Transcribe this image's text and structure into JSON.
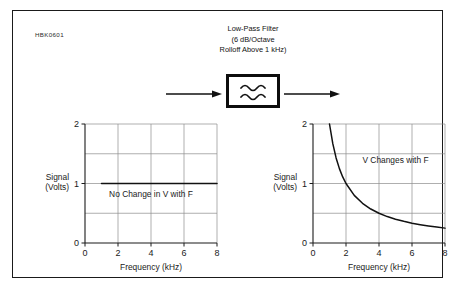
{
  "figure": {
    "id_code": "HBK0601",
    "border_color": "#1a1a1a",
    "background": "#ffffff"
  },
  "filter_block": {
    "caption_line1": "Low-Pass Filter",
    "caption_line2": "(6 dB/Octave",
    "caption_line3": "Rolloff Above 1 kHz)",
    "symbol": "two-wave-lowpass-symbol",
    "input_arrow": "arrow-right-icon",
    "output_arrow": "arrow-right-icon",
    "box_color": "#0d0d0d"
  },
  "chart_data": [
    {
      "id": "input-signal",
      "type": "line",
      "title": "",
      "xlabel": "Frequency (kHz)",
      "ylabel": "Signal\n(Volts)",
      "ylabel_line1": "Signal",
      "ylabel_line2": "(Volts)",
      "annotation": "No Change in V with F",
      "xlim": [
        0,
        8
      ],
      "ylim": [
        0,
        2
      ],
      "xticks": [
        0,
        2,
        4,
        6,
        8
      ],
      "xtick_labels": [
        "0",
        "2",
        "4",
        "6",
        "8"
      ],
      "yticks": [
        0,
        1,
        2
      ],
      "ytick_labels": [
        "0",
        "1",
        "2"
      ],
      "xgrid": [
        2,
        4,
        6
      ],
      "ygrid": [
        0.5,
        1,
        1.5
      ],
      "grid": true,
      "grid_color": "#8c8c8c",
      "series": [
        {
          "name": "Flat response",
          "color": "#111111",
          "x": [
            1,
            2,
            3,
            4,
            5,
            6,
            7,
            8
          ],
          "values": [
            1,
            1,
            1,
            1,
            1,
            1,
            1,
            1
          ]
        }
      ]
    },
    {
      "id": "output-signal",
      "type": "line",
      "title": "",
      "xlabel": "Frequency (kHz)",
      "ylabel": "Signal\n(Volts)",
      "ylabel_line1": "Signal",
      "ylabel_line2": "(Volts)",
      "annotation": "V Changes with F",
      "xlim": [
        0,
        8
      ],
      "ylim": [
        0,
        2
      ],
      "xticks": [
        0,
        2,
        4,
        6,
        8
      ],
      "xtick_labels": [
        "0",
        "2",
        "4",
        "6",
        "8"
      ],
      "yticks": [
        0,
        1,
        2
      ],
      "ytick_labels": [
        "0",
        "1",
        "2"
      ],
      "xgrid": [
        2,
        4,
        6
      ],
      "ygrid": [
        0.5,
        1,
        1.5
      ],
      "grid": true,
      "grid_color": "#8c8c8c",
      "series": [
        {
          "name": "1/f rolloff",
          "color": "#111111",
          "x": [
            1.0,
            1.2,
            1.4,
            1.6,
            1.8,
            2.0,
            2.5,
            3.0,
            3.5,
            4.0,
            4.5,
            5.0,
            5.5,
            6.0,
            6.5,
            7.0,
            7.5,
            8.0
          ],
          "values": [
            2.0,
            1.67,
            1.43,
            1.25,
            1.11,
            1.0,
            0.8,
            0.667,
            0.571,
            0.5,
            0.444,
            0.4,
            0.364,
            0.333,
            0.308,
            0.286,
            0.267,
            0.25
          ]
        }
      ]
    }
  ]
}
